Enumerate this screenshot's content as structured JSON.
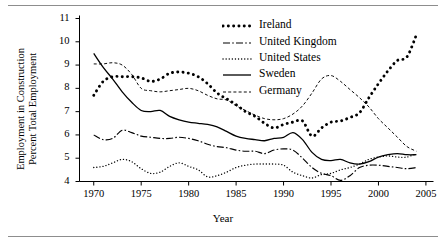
{
  "figure": {
    "xlabel": "Year",
    "ylabel_line1": "Employment in Construction",
    "ylabel_line2": "Percent Total Employment"
  },
  "chart_data": {
    "type": "line",
    "title": "",
    "xlabel": "Year",
    "ylabel": "Employment in Construction Percent Total Employment",
    "xlim": [
      1968.5,
      2005.8
    ],
    "ylim": [
      4,
      11
    ],
    "xticks": [
      1970,
      1975,
      1980,
      1985,
      1990,
      1995,
      2000,
      2005
    ],
    "yticks": [
      4,
      5,
      6,
      7,
      8,
      9,
      10,
      11
    ],
    "grid": false,
    "legend_position": "top-right",
    "x": [
      1970,
      1971,
      1972,
      1973,
      1974,
      1975,
      1976,
      1977,
      1978,
      1979,
      1980,
      1981,
      1982,
      1983,
      1984,
      1985,
      1986,
      1987,
      1988,
      1989,
      1990,
      1991,
      1992,
      1993,
      1994,
      1995,
      1996,
      1997,
      1998,
      1999,
      2000,
      2001,
      2002,
      2003,
      2004
    ],
    "series": [
      {
        "name": "Ireland",
        "style": "dotted-thick",
        "values": [
          7.7,
          8.3,
          8.5,
          8.5,
          8.5,
          8.45,
          8.3,
          8.4,
          8.65,
          8.7,
          8.65,
          8.5,
          8.2,
          7.8,
          7.55,
          7.3,
          7.0,
          6.8,
          6.5,
          6.3,
          6.45,
          6.55,
          6.6,
          5.95,
          6.3,
          6.55,
          6.6,
          6.75,
          6.95,
          7.6,
          8.2,
          8.75,
          9.2,
          9.35,
          10.3
        ]
      },
      {
        "name": "United Kingdom",
        "style": "dash-dot",
        "values": [
          6.0,
          5.8,
          5.85,
          6.2,
          6.1,
          5.95,
          5.9,
          5.85,
          5.85,
          5.9,
          5.85,
          5.75,
          5.6,
          5.5,
          5.45,
          5.35,
          5.3,
          5.3,
          5.2,
          5.35,
          5.4,
          5.35,
          5.0,
          4.6,
          4.35,
          4.25,
          4.05,
          4.25,
          4.6,
          4.7,
          4.7,
          4.65,
          4.6,
          4.55,
          4.6
        ]
      },
      {
        "name": "United States",
        "style": "dotted-thin",
        "values": [
          4.6,
          4.65,
          4.8,
          4.95,
          4.85,
          4.55,
          4.35,
          4.4,
          4.65,
          4.8,
          4.65,
          4.5,
          4.2,
          4.25,
          4.4,
          4.6,
          4.7,
          4.75,
          4.75,
          4.75,
          4.7,
          4.4,
          4.25,
          4.15,
          4.3,
          4.35,
          4.5,
          4.6,
          4.75,
          4.95,
          5.05,
          5.1,
          5.05,
          5.05,
          5.2
        ]
      },
      {
        "name": "Sweden",
        "style": "solid",
        "values": [
          9.5,
          8.9,
          8.4,
          7.85,
          7.4,
          7.05,
          7.0,
          7.05,
          6.8,
          6.65,
          6.55,
          6.5,
          6.45,
          6.35,
          6.15,
          5.95,
          5.85,
          5.8,
          5.75,
          5.85,
          5.9,
          6.1,
          5.8,
          5.25,
          4.95,
          4.9,
          4.95,
          4.8,
          4.75,
          4.85,
          5.05,
          5.15,
          5.2,
          5.15,
          5.15
        ]
      },
      {
        "name": "Germany",
        "style": "dashed-thin",
        "values": [
          9.05,
          9.05,
          9.1,
          9.0,
          8.6,
          8.0,
          7.9,
          7.85,
          7.9,
          7.95,
          8.0,
          7.9,
          7.7,
          7.55,
          7.5,
          7.25,
          7.05,
          6.85,
          6.7,
          6.65,
          6.7,
          6.9,
          7.25,
          7.8,
          8.4,
          8.55,
          8.3,
          7.95,
          7.6,
          7.2,
          6.7,
          6.3,
          5.9,
          5.5,
          5.3
        ]
      }
    ]
  },
  "legend": {
    "items": [
      {
        "label": "Ireland",
        "style": "dotted-thick"
      },
      {
        "label": "United Kingdom",
        "style": "dash-dot"
      },
      {
        "label": "United States",
        "style": "dotted-thin"
      },
      {
        "label": "Sweden",
        "style": "solid"
      },
      {
        "label": "Germany",
        "style": "dashed-thin"
      }
    ]
  }
}
